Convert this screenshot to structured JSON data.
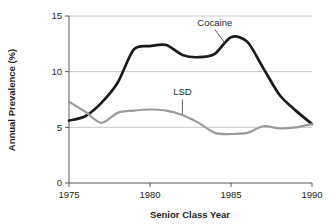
{
  "chart_data": {
    "type": "line",
    "title": "",
    "xlabel": "Senior Class Year",
    "ylabel": "Annual Prevalence (%)",
    "xlim": [
      1975,
      1990
    ],
    "ylim": [
      0,
      15
    ],
    "xticks": [
      "1975",
      "1980",
      "1985",
      "1990"
    ],
    "xtick_values": [
      1975,
      1980,
      1985,
      1990
    ],
    "yticks": [
      "0",
      "5",
      "10",
      "15"
    ],
    "ytick_values": [
      0,
      5,
      10,
      15
    ],
    "grid": "horizontal",
    "legend": "inline-annotations",
    "x": [
      1975,
      1976,
      1977,
      1978,
      1979,
      1980,
      1981,
      1982,
      1983,
      1984,
      1985,
      1986,
      1987,
      1988,
      1989,
      1990
    ],
    "series": [
      {
        "name": "Cocaine",
        "color": "#1a1a1a",
        "label_x": 1984.0,
        "label_y": 14.1,
        "values": [
          5.6,
          6.0,
          7.2,
          9.0,
          12.0,
          12.3,
          12.4,
          11.5,
          11.3,
          11.6,
          13.1,
          12.7,
          10.3,
          7.9,
          6.5,
          5.3
        ]
      },
      {
        "name": "LSD",
        "color": "#9b9b9b",
        "label_x": 1982.0,
        "label_y": 7.9,
        "values": [
          7.3,
          6.4,
          5.4,
          6.3,
          6.5,
          6.6,
          6.5,
          6.1,
          5.4,
          4.5,
          4.4,
          4.5,
          5.1,
          4.9,
          5.0,
          5.3
        ]
      }
    ],
    "annotations": [
      {
        "text": "Cocaine",
        "leader_from": [
          1984.0,
          13.8
        ],
        "leader_to": [
          1984.6,
          12.6
        ]
      },
      {
        "text": "LSD",
        "leader_from": [
          1982.0,
          7.5
        ],
        "leader_to": [
          1982.0,
          6.2
        ]
      }
    ],
    "colors": {
      "axis": "#5a5a5a",
      "grid": "#c8c8c8",
      "text": "#231f20",
      "cocaine": "#1a1a1a",
      "lsd": "#9b9b9b",
      "background": "#ffffff"
    }
  }
}
